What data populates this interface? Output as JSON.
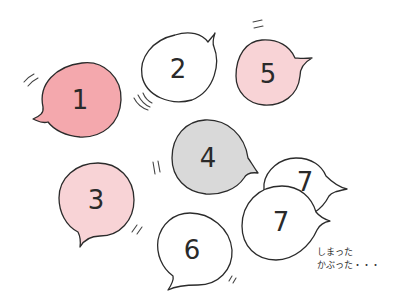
{
  "illustration": {
    "description": "Hand-drawn numbered speech bubbles",
    "colors": {
      "background": "#ffffff",
      "pink_strong": "#f4a8ad",
      "pink_light": "#f8d3d6",
      "gray": "#d9d9d9",
      "white": "#ffffff",
      "ink": "#2b2b2b"
    },
    "bubbles": [
      {
        "label": "1",
        "fill": "pink_strong"
      },
      {
        "label": "2",
        "fill": "white"
      },
      {
        "label": "5",
        "fill": "pink_light"
      },
      {
        "label": "4",
        "fill": "gray"
      },
      {
        "label": "3",
        "fill": "pink_light"
      },
      {
        "label": "6",
        "fill": "white"
      },
      {
        "label": "7",
        "fill": "white"
      },
      {
        "label": "7",
        "fill": "white"
      }
    ],
    "note": {
      "line1": "しまった",
      "line2": "かぶった・・・"
    }
  }
}
